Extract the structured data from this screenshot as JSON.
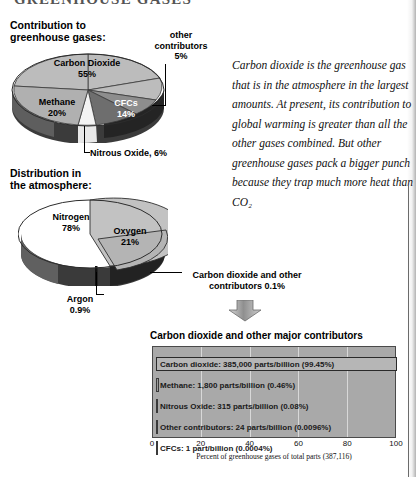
{
  "banner": "GREENHOUSE GASES",
  "headings": {
    "contribution": "Contribution to\ngreenhouse gases:",
    "distribution": "Distribution in\nthe atmosphere:"
  },
  "pie_contribution": {
    "title": "Contribution to greenhouse gases:",
    "labels": {
      "co2": "Carbon Dioxide\n55%",
      "methane": "Methane\n20%",
      "cfc": "CFCs\n14%",
      "other": "other\ncontributors\n5%",
      "n2o": "Nitrous Oxide, 6%"
    }
  },
  "pie_distribution": {
    "title": "Distribution in the atmosphere:",
    "labels": {
      "nitrogen": "Nitrogen\n78%",
      "oxygen": "Oxygen\n21%",
      "argon": "Argon\n0.9%",
      "carbon_other": "Carbon dioxide and other\ncontributors 0.1%"
    }
  },
  "body_text": "Carbon dioxide is the greenhouse gas that is in the atmosphere in the largest amounts. At present, its contribution to global warming is greater than all the other gases combined.  But other greenhouse gases pack a bigger punch because they trap much more heat than CO₂",
  "bar_chart": {
    "title": "Carbon dioxide and other major contributors",
    "caption": "Percent of greenhouse gases of total parts (387,116)"
  },
  "chart_data": [
    {
      "type": "pie",
      "title": "Contribution to greenhouse gases:",
      "categories": [
        "Carbon Dioxide",
        "Methane",
        "CFCs",
        "Nitrous Oxide",
        "other contributors"
      ],
      "values": [
        55,
        20,
        14,
        6,
        5
      ],
      "value_labels": [
        "55%",
        "20%",
        "14%",
        "6%",
        "5%"
      ],
      "colors": [
        "#bcbcbc",
        "#b0b0b0",
        "#6e6e6e",
        "#f2f2f2",
        "#8d8d8d"
      ],
      "legend": "none"
    },
    {
      "type": "pie",
      "title": "Distribution in the atmosphere:",
      "categories": [
        "Nitrogen",
        "Oxygen",
        "Argon",
        "Carbon dioxide and other contributors"
      ],
      "values": [
        78,
        21,
        0.9,
        0.1
      ],
      "value_labels": [
        "78%",
        "21%",
        "0.9%",
        "0.1%"
      ],
      "colors": [
        "#c2c2c2",
        "#b4b4b4",
        "#2e2e2e",
        "#262626"
      ],
      "legend": "none"
    },
    {
      "type": "bar",
      "title": "Carbon dioxide and other major contributors",
      "xlabel": "Percent of greenhouse gases of total parts (387,116)",
      "ylabel": "",
      "xlim": [
        0,
        100
      ],
      "xticks": [
        "0",
        "20",
        "40",
        "60",
        "80",
        "100"
      ],
      "grid": true,
      "orientation": "horizontal",
      "categories": [
        "Carbon dioxide",
        "Methane",
        "Nitrous Oxide",
        "Other contributors",
        "CFCs"
      ],
      "values": [
        99.45,
        0.46,
        0.08,
        0.0096,
        0.0004
      ],
      "bar_labels": [
        "Carbon dioxide: 385,000 parts/billion (99.45%)",
        "Methane: 1,800 parts/billion (0.46%)",
        "Nitrous Oxide: 315 parts/billion (0.08%)",
        "Other contributors: 24 parts/billion (0.0096%)",
        "CFCs: 1 part/billion (0.0004%)"
      ],
      "parts_per_billion": [
        385000,
        1800,
        315,
        24,
        1
      ]
    }
  ]
}
